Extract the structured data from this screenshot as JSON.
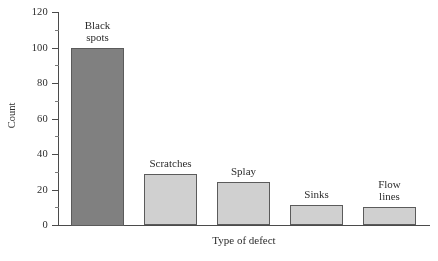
{
  "chart_data": {
    "type": "bar",
    "title": "",
    "xlabel": "Type of defect",
    "ylabel": "Count",
    "categories": [
      "Black spots",
      "Scratches",
      "Splay",
      "Sinks",
      "Flow lines"
    ],
    "values": [
      100,
      29,
      24,
      11,
      10
    ],
    "ylim": [
      0,
      120
    ],
    "ytick_labels": [
      "0",
      "20",
      "40",
      "60",
      "80",
      "100",
      "120"
    ],
    "ytick_values": [
      0,
      20,
      40,
      60,
      80,
      100,
      120
    ],
    "minor_tick_values": [
      10,
      30,
      50,
      70,
      90,
      110
    ],
    "grid": false,
    "legend": false,
    "bar_colors": [
      "#808080",
      "#d2d2d2",
      "#d2d2d2",
      "#d2d2d2",
      "#d2d2d2"
    ],
    "bar_border_color": "#5a5a5a",
    "axis_color": "#4a4a4a",
    "background": "#ffffff",
    "bars": [
      {
        "label": "Black\nspots",
        "value": 100,
        "color": "#808080"
      },
      {
        "label": "Scratches",
        "value": 29,
        "color": "#d2d2d2"
      },
      {
        "label": "Splay",
        "value": 24,
        "color": "#d2d2d2"
      },
      {
        "label": "Sinks",
        "value": 11,
        "color": "#d2d2d2"
      },
      {
        "label": "Flow\nlines",
        "value": 10,
        "color": "#d2d2d2"
      }
    ]
  }
}
